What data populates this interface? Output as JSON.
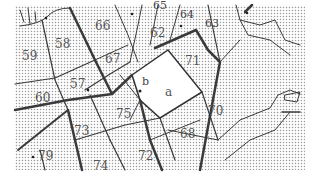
{
  "map": {
    "type": "cadastral parcel map",
    "colors": {
      "background": "#ffffff",
      "stipple": "#9a9a9a",
      "parcel_line": "#3a3a3a",
      "highlight_parcel_fill": "#ffffff",
      "label": "#555555"
    },
    "parcels": [
      {
        "id": "59",
        "label": "59"
      },
      {
        "id": "58",
        "label": "58"
      },
      {
        "id": "66",
        "label": "66"
      },
      {
        "id": "65",
        "label": "65"
      },
      {
        "id": "64",
        "label": "64"
      },
      {
        "id": "63",
        "label": "63"
      },
      {
        "id": "62",
        "label": "62"
      },
      {
        "id": "67",
        "label": "67"
      },
      {
        "id": "57",
        "label": "57"
      },
      {
        "id": "60",
        "label": "60"
      },
      {
        "id": "71",
        "label": "71"
      },
      {
        "id": "a",
        "label": "a"
      },
      {
        "id": "b",
        "label": "b"
      },
      {
        "id": "75",
        "label": "75"
      },
      {
        "id": "73",
        "label": "73"
      },
      {
        "id": "70",
        "label": "70"
      },
      {
        "id": "68",
        "label": "68"
      },
      {
        "id": "79",
        "label": "79"
      },
      {
        "id": "72",
        "label": "72"
      },
      {
        "id": "74",
        "label": "74"
      }
    ]
  }
}
